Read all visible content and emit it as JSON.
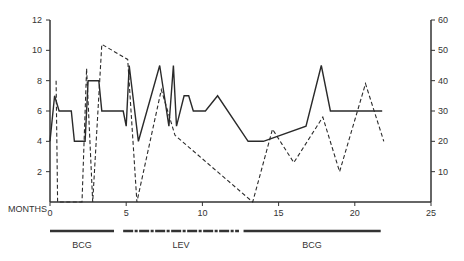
{
  "chart_data": {
    "type": "line",
    "title": "",
    "xlabel": "MONTHS",
    "ylabel_left": "",
    "ylabel_right": "",
    "xlim": [
      0,
      25
    ],
    "ylim_left": [
      0,
      12
    ],
    "ylim_right": [
      0,
      60
    ],
    "x_ticks": [
      0,
      5,
      10,
      15,
      20,
      25
    ],
    "y_ticks_left": [
      2,
      4,
      6,
      8,
      10,
      12
    ],
    "y_ticks_right": [
      10,
      20,
      30,
      40,
      50,
      60
    ],
    "grid": false,
    "series": [
      {
        "name": "solid",
        "axis": "left",
        "style": "solid",
        "x": [
          0,
          0.3,
          0.6,
          1.4,
          1.6,
          2.3,
          2.5,
          3.2,
          3.4,
          4.8,
          5.0,
          5.2,
          5.8,
          7.2,
          7.8,
          8.1,
          8.3,
          8.8,
          9.1,
          9.4,
          10.2,
          11.0,
          13.0,
          14.0,
          16.8,
          17.8,
          18.4,
          21.8
        ],
        "y": [
          4,
          7,
          6,
          6,
          4,
          4,
          8,
          8,
          6,
          6,
          5,
          9,
          4,
          9,
          5,
          9,
          5,
          7,
          7,
          6,
          6,
          7,
          4,
          4,
          5,
          9,
          6,
          6
        ]
      },
      {
        "name": "dashed",
        "axis": "right",
        "style": "dashed",
        "x": [
          0.4,
          0.5,
          2.1,
          2.4,
          2.8,
          3.4,
          5.1,
          5.7,
          7.3,
          8.2,
          13.3,
          14.6,
          16.0,
          17.9,
          19.0,
          20.7,
          21.9
        ],
        "y": [
          40,
          0,
          0,
          44,
          0,
          52,
          47,
          0,
          37,
          22,
          0,
          24,
          13,
          28,
          10,
          39,
          20
        ]
      }
    ],
    "treatments": [
      {
        "label": "BCG",
        "start": 0,
        "end": 4.2,
        "pattern": "solid"
      },
      {
        "label": "LEV",
        "start": 4.8,
        "end": 12.4,
        "pattern": "hatched"
      },
      {
        "label": "BCG",
        "start": 12.7,
        "end": 21.7,
        "pattern": "solid"
      }
    ]
  }
}
